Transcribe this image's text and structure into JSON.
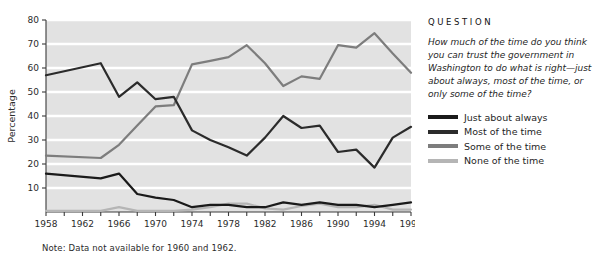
{
  "chart_data": {
    "type": "line",
    "title": "",
    "xlabel": "",
    "ylabel": "Percentage",
    "xlim": [
      1958,
      1998
    ],
    "ylim": [
      0,
      80
    ],
    "ytick_step": 10,
    "xtick_step": 2,
    "grid": true,
    "gridline_color": "#ffffff",
    "plot_background": "#e2e2e2",
    "legend_position": "right",
    "x": [
      1958,
      1964,
      1966,
      1968,
      1970,
      1972,
      1974,
      1976,
      1978,
      1980,
      1982,
      1984,
      1986,
      1988,
      1990,
      1992,
      1994,
      1996,
      1998
    ],
    "xtick_labels": [
      "1958",
      "1962",
      "1966",
      "1970",
      "1974",
      "1978",
      "1982",
      "1986",
      "1990",
      "1994",
      "1998"
    ],
    "ytick_labels": [
      "10",
      "20",
      "30",
      "40",
      "50",
      "60",
      "70",
      "80"
    ],
    "series": [
      {
        "name": "Just about always",
        "color": "#1a1a1a",
        "values": [
          16.0,
          14.0,
          16.0,
          7.5,
          6.0,
          5.0,
          2.0,
          3.0,
          3.0,
          2.0,
          2.0,
          4.0,
          3.0,
          4.0,
          3.0,
          3.0,
          2.0,
          3.0,
          4.0
        ]
      },
      {
        "name": "Most of the time",
        "color": "#2b2b2b",
        "values": [
          57.0,
          62.0,
          48.0,
          54.0,
          47.0,
          48.0,
          34.0,
          30.0,
          27.0,
          23.5,
          31.0,
          40.0,
          35.0,
          36.0,
          25.0,
          26.0,
          18.5,
          31.0,
          35.5
        ]
      },
      {
        "name": "Some of the time",
        "color": "#7d7d7d",
        "values": [
          23.5,
          22.5,
          28.0,
          36.0,
          44.0,
          44.5,
          61.5,
          63.0,
          64.5,
          69.5,
          62.0,
          52.5,
          56.5,
          55.5,
          69.5,
          68.5,
          74.5,
          66.0,
          58.0
        ]
      },
      {
        "name": "None of the time",
        "color": "#b5b5b5",
        "values": [
          0.5,
          0.5,
          2.0,
          0.5,
          0.5,
          0.5,
          1.0,
          2.0,
          3.5,
          3.5,
          1.5,
          1.0,
          2.5,
          3.5,
          2.0,
          2.0,
          3.0,
          1.0,
          1.0
        ]
      }
    ],
    "note": "Note:  Data not available for 1960 and 1962."
  },
  "side": {
    "heading": "QUESTION",
    "question": "How much of the time do you think you can trust the government in Washington to do what is right—just about always, most of the time, or only some of the time?"
  }
}
